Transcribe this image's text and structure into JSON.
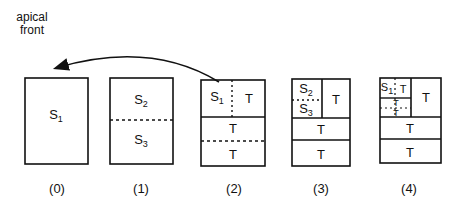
{
  "annotation": {
    "line1": "apical",
    "line2": "front"
  },
  "stages": [
    {
      "caption": "(0)",
      "labels": {
        "s1": "S",
        "s1_sub": "1"
      }
    },
    {
      "caption": "(1)",
      "labels": {
        "s2": "S",
        "s2_sub": "2",
        "s3": "S",
        "s3_sub": "3"
      }
    },
    {
      "caption": "(2)",
      "labels": {
        "s1": "S",
        "s1_sub": "1",
        "t_top": "T",
        "t_mid": "T",
        "t_bot": "T"
      }
    },
    {
      "caption": "(3)",
      "labels": {
        "s2": "S",
        "s2_sub": "2",
        "s3": "S",
        "s3_sub": "3",
        "t_right": "T",
        "t_mid": "T",
        "t_bot": "T"
      }
    },
    {
      "caption": "(4)",
      "labels": {
        "s1": "S",
        "s1_sub": "1",
        "t_a": "T",
        "t_b": "T",
        "t_c": "T",
        "t_right": "T",
        "t_mid": "T",
        "t_bot": "T"
      }
    }
  ],
  "colors": {
    "stroke": "#111111",
    "background": "#ffffff"
  }
}
